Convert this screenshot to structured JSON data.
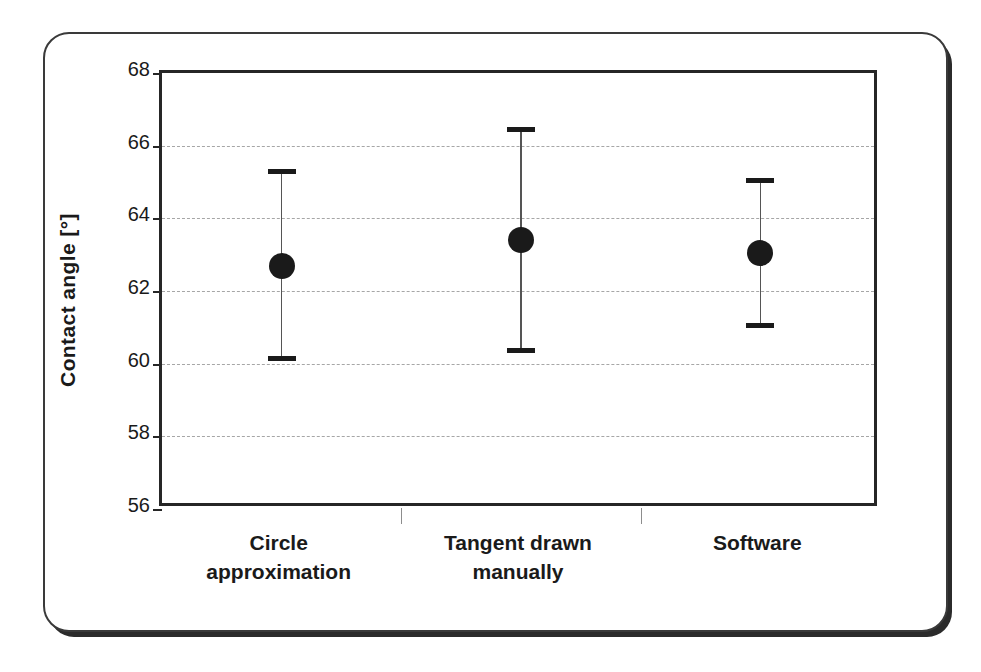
{
  "chart_data": {
    "type": "scatter",
    "title": "",
    "subtitle": "",
    "xlabel": "",
    "ylabel": "Contact angle [°]",
    "categories": [
      "Circle approximation",
      "Tangent drawn manually",
      "Software"
    ],
    "category_lines": [
      [
        "Circle",
        "approximation"
      ],
      [
        "Tangent drawn",
        "manually"
      ],
      [
        "Software",
        ""
      ]
    ],
    "values": [
      62.7,
      63.4,
      63.05
    ],
    "error_low": [
      60.15,
      60.35,
      61.05
    ],
    "error_high": [
      65.3,
      66.45,
      65.05
    ],
    "series": [
      {
        "name": "Contact angle",
        "values": [
          62.7,
          63.4,
          63.05
        ],
        "error_low": [
          60.15,
          60.35,
          61.05
        ],
        "error_high": [
          65.3,
          66.45,
          65.05
        ]
      }
    ],
    "ylim": [
      56,
      68
    ],
    "ytick_step": 2,
    "ytick_labels": [
      "68",
      "66",
      "64",
      "62",
      "60",
      "58",
      "56"
    ],
    "ytick_values": [
      68,
      66,
      64,
      62,
      60,
      58,
      56
    ],
    "grid": "horizontal-dashed",
    "legend": "none",
    "marker": "filled-circle",
    "colors": {
      "marker": "#1a1a1a",
      "error_bar": "#555555",
      "gridline": "#a6a6a6",
      "axis": "#262626",
      "frame": "#3a3a3a",
      "background": "#ffffff"
    }
  }
}
